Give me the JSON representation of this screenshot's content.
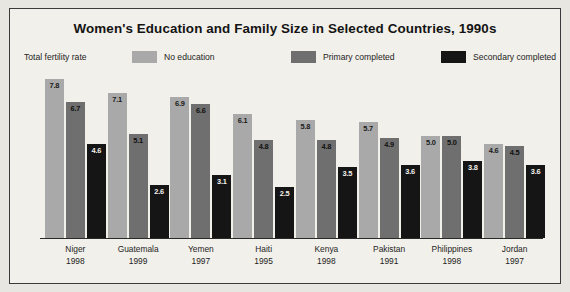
{
  "chart_data": {
    "type": "bar",
    "title": "Women's Education and Family Size in Selected Countries, 1990s",
    "ylabel": "Total fertility rate",
    "xlabel": "",
    "ylim": [
      0,
      8.2
    ],
    "grid": false,
    "legend_position": "top",
    "categories": [
      "Niger",
      "Guatemala",
      "Yemen",
      "Haiti",
      "Kenya",
      "Pakistan",
      "Philippines",
      "Jordan"
    ],
    "category_years": [
      "1998",
      "1999",
      "1997",
      "1995",
      "1998",
      "1991",
      "1998",
      "1997"
    ],
    "series": [
      {
        "name": "No education",
        "color": "#a9a9a9",
        "values": [
          7.8,
          7.1,
          6.9,
          6.1,
          5.8,
          5.7,
          5.0,
          4.6
        ]
      },
      {
        "name": "Primary completed",
        "color": "#6f6f6f",
        "values": [
          6.7,
          5.1,
          6.6,
          4.8,
          4.8,
          4.9,
          5.0,
          4.5
        ]
      },
      {
        "name": "Secondary completed",
        "color": "#151515",
        "values": [
          4.6,
          2.6,
          3.1,
          2.5,
          3.5,
          3.6,
          3.8,
          3.6
        ]
      }
    ]
  },
  "legend": {
    "caption": "Total fertility rate",
    "items": [
      "No education",
      "Primary completed",
      "Secondary completed"
    ]
  }
}
